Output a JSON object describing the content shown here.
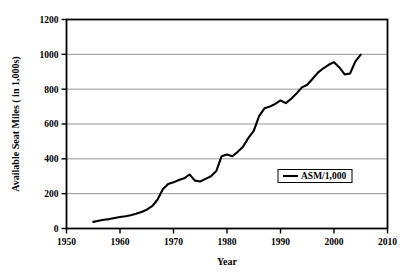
{
  "chart_data": {
    "type": "line",
    "title": "",
    "xlabel": "Year",
    "ylabel": "Available Seat Miles ( in 1,000s)",
    "xlim": [
      1950,
      2010
    ],
    "ylim": [
      0,
      1200
    ],
    "xticks": [
      1950,
      1960,
      1970,
      1980,
      1990,
      2000,
      2010
    ],
    "yticks": [
      0,
      200,
      400,
      600,
      800,
      1000,
      1200
    ],
    "xtick_labels": [
      "1950",
      "1960",
      "1970",
      "1980",
      "1990",
      "2000",
      "2010"
    ],
    "ytick_labels": [
      "0",
      "200",
      "400",
      "600",
      "800",
      "1000",
      "1200"
    ],
    "grid": "horizontal",
    "legend_position": "center-right",
    "series": [
      {
        "name": "ASM/1,000",
        "color": "#000000",
        "x": [
          1955,
          1956,
          1957,
          1958,
          1959,
          1960,
          1961,
          1962,
          1963,
          1964,
          1965,
          1966,
          1967,
          1968,
          1969,
          1970,
          1971,
          1972,
          1973,
          1974,
          1975,
          1976,
          1977,
          1978,
          1979,
          1980,
          1981,
          1982,
          1983,
          1984,
          1985,
          1986,
          1987,
          1988,
          1989,
          1990,
          1991,
          1992,
          1993,
          1994,
          1995,
          1996,
          1997,
          1998,
          1999,
          2000,
          2001,
          2002,
          2003,
          2004,
          2005
        ],
        "values": [
          38,
          44,
          50,
          54,
          60,
          66,
          70,
          76,
          85,
          95,
          108,
          128,
          165,
          225,
          255,
          265,
          278,
          288,
          310,
          275,
          270,
          285,
          300,
          330,
          415,
          425,
          415,
          440,
          470,
          520,
          560,
          645,
          690,
          700,
          715,
          735,
          720,
          745,
          775,
          810,
          825,
          860,
          895,
          920,
          940,
          955,
          925,
          885,
          890,
          960,
          998
        ]
      }
    ]
  },
  "legend": {
    "entries": [
      {
        "label": "ASM/1,000",
        "color": "#000000"
      }
    ]
  },
  "axes": {
    "x_title": "Year",
    "y_title": "Available Seat Miles ( in 1,000s)"
  }
}
